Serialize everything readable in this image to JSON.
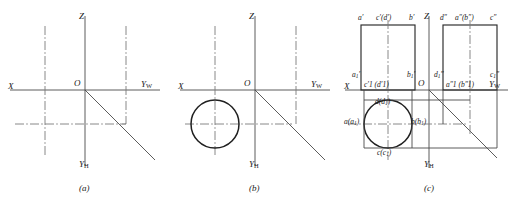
{
  "figure": {
    "domain": "engineering-orthographic-projection",
    "width": 514,
    "height": 202,
    "background": "#ffffff",
    "stroke_solid": "#3d3d3d",
    "stroke_heavy": "#1a1a1a",
    "stroke_center": "#6b6b6b",
    "caption_a": "(a)",
    "caption_b": "(b)",
    "caption_c": "(c)"
  },
  "axes": {
    "x_label": "X",
    "origin_label": "O",
    "z_label": "Z",
    "yw_label_main": "Y",
    "yw_label_sub": "W",
    "yh_label_main": "Y",
    "yh_label_sub": "H"
  },
  "panel_a": {
    "name": "empty-projection-axes",
    "axis_x": "X",
    "axis_z": "Z",
    "axis_yw_main": "Y",
    "axis_yw_sub": "W",
    "axis_yh_main": "Y",
    "axis_yh_sub": "H",
    "origin": "O",
    "caption": "(a)"
  },
  "panel_b": {
    "name": "circle-top-view-axes",
    "axis_x": "X",
    "axis_z": "Z",
    "axis_yw_main": "Y",
    "axis_yw_sub": "W",
    "axis_yh_main": "Y",
    "axis_yh_sub": "H",
    "origin": "O",
    "caption": "(b)"
  },
  "panel_c": {
    "name": "complete-three-view-projection",
    "axis_x": "X",
    "axis_z": "Z",
    "axis_yw_main": "Y",
    "axis_yw_sub": "W",
    "axis_yh_main": "Y",
    "axis_yh_sub": "H",
    "origin": "O",
    "caption": "(c)",
    "front_view_top_labels": [
      {
        "id": "a-prime",
        "main": "a",
        "prime": "′",
        "paren": ""
      },
      {
        "id": "cd-prime",
        "main": "c",
        "prime": "′",
        "paren": "(d′)"
      },
      {
        "id": "b-prime",
        "main": "b",
        "prime": "′",
        "paren": ""
      }
    ],
    "side_view_top_labels": [
      {
        "id": "d-dprime",
        "main": "d",
        "prime": "″",
        "paren": ""
      },
      {
        "id": "ab-dprime",
        "main": "a",
        "prime": "″",
        "paren": "(b″)"
      },
      {
        "id": "c-dprime",
        "main": "c",
        "prime": "″",
        "paren": ""
      }
    ],
    "front_view_bottom_labels": [
      {
        "id": "a1-prime",
        "text": "a",
        "sub": "1",
        "prime": "′"
      },
      {
        "id": "b1-prime",
        "text": "b",
        "sub": "1",
        "prime": "′"
      }
    ],
    "front_view_axis_labels": [
      {
        "id": "c1d1-prime",
        "text": "c′1 (d′1)"
      }
    ],
    "side_view_bottom_labels": [
      {
        "id": "d1-dprime",
        "text": "d",
        "sub": "1",
        "prime": "″"
      },
      {
        "id": "c1-dprime",
        "text": "c",
        "sub": "1",
        "prime": "″"
      }
    ],
    "side_view_axis_labels": [
      {
        "id": "a1b1-dprime",
        "text": "a″1 (b″1)"
      }
    ],
    "top_view_labels": [
      {
        "id": "d-d1",
        "text": "d(d",
        "sub": "1",
        "tail": ")"
      },
      {
        "id": "a-a1",
        "text": "a(a",
        "sub": "1",
        "tail": ")"
      },
      {
        "id": "b-b1",
        "text": "b(b",
        "sub": "1",
        "tail": ")"
      },
      {
        "id": "c-c1",
        "text": "c(c",
        "sub": "1",
        "tail": ")"
      }
    ]
  }
}
